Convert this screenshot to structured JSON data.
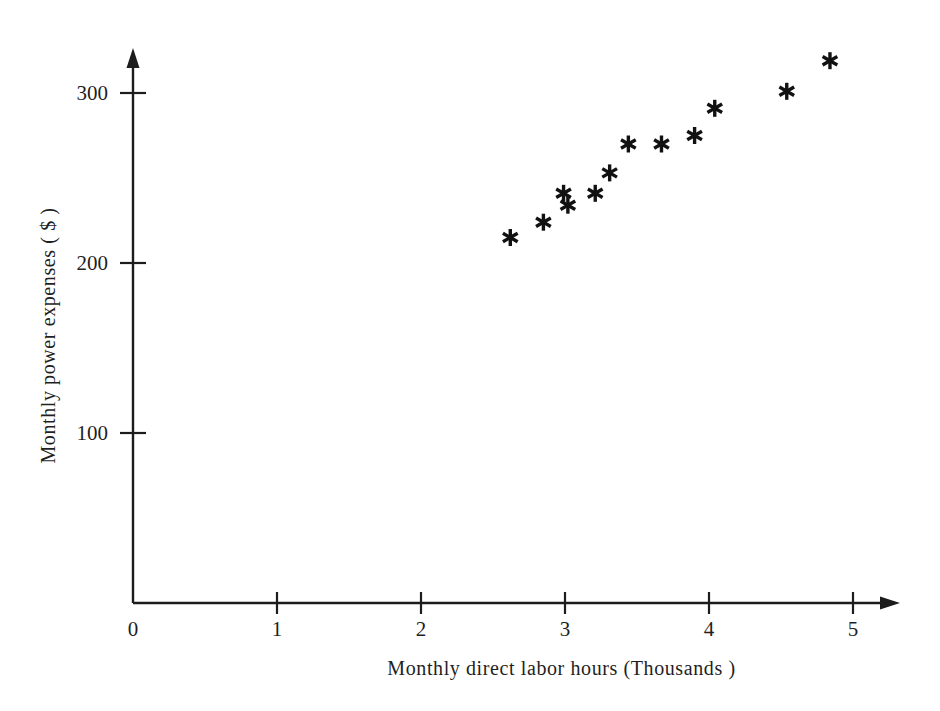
{
  "chart_data": {
    "type": "scatter",
    "title": "",
    "xlabel": "Monthly direct labor hours (Thousands )",
    "ylabel": "Monthly power expenses ( $ )",
    "xlim": [
      0,
      5.35
    ],
    "ylim": [
      0,
      330
    ],
    "xticks": [
      0,
      1,
      2,
      3,
      4,
      5
    ],
    "xticklabels": [
      "0",
      "1",
      "2",
      "3",
      "4",
      "5"
    ],
    "yticks": [
      100,
      200,
      300
    ],
    "yticklabels": [
      "100",
      "200",
      "300"
    ],
    "grid": false,
    "legend": null,
    "marker": "asterisk",
    "marker_color": "#111111",
    "axis_color": "#1c1c1c",
    "points": [
      {
        "x": 2.62,
        "y": 215
      },
      {
        "x": 2.85,
        "y": 224
      },
      {
        "x": 2.99,
        "y": 241
      },
      {
        "x": 3.02,
        "y": 234
      },
      {
        "x": 3.21,
        "y": 241
      },
      {
        "x": 3.31,
        "y": 253
      },
      {
        "x": 3.44,
        "y": 270
      },
      {
        "x": 3.67,
        "y": 270
      },
      {
        "x": 3.9,
        "y": 275
      },
      {
        "x": 4.04,
        "y": 291
      },
      {
        "x": 4.54,
        "y": 301
      },
      {
        "x": 4.84,
        "y": 319
      }
    ]
  },
  "axes": {
    "x_axis_name": "horizontal-axis",
    "y_axis_name": "vertical-axis"
  }
}
